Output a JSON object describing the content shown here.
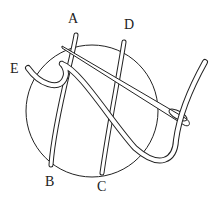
{
  "diagram": {
    "type": "embroidery stitch illustration",
    "labels": [
      {
        "id": "A",
        "text": "A"
      },
      {
        "id": "B",
        "text": "B"
      },
      {
        "id": "C",
        "text": "C"
      },
      {
        "id": "D",
        "text": "D"
      },
      {
        "id": "E",
        "text": "E"
      }
    ],
    "colors": {
      "line": "#222222",
      "background": "#ffffff"
    }
  }
}
